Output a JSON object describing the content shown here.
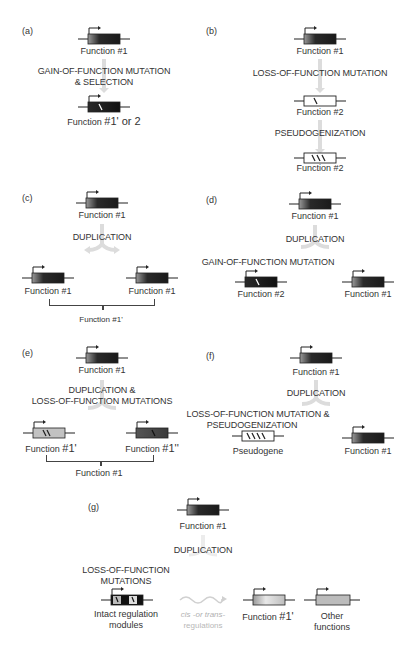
{
  "figure": {
    "page_number_hint": "",
    "panels": {
      "a": {
        "label": "(a)",
        "top_gene": "Function #1",
        "step": [
          "GAIN-OF-FUNCTION MUTATION",
          "& SELECTION"
        ],
        "bottom_gene_prefix": "Function ",
        "bottom_gene_suffix": "#1' or 2"
      },
      "b": {
        "label": "(b)",
        "top_gene": "Function #1",
        "step1": "LOSS-OF-FUNCTION MUTATION",
        "mid_gene": "Function #2",
        "step2": "PSEUDOGENIZATION",
        "bottom_gene": "Function #2"
      },
      "c": {
        "label": "(c)",
        "top_gene": "Function #1",
        "step": "DUPLICATION",
        "left_gene": "Function #1",
        "right_gene": "Function #1",
        "combined": "Function #1'"
      },
      "d": {
        "label": "(d)",
        "top_gene": "Function #1",
        "step": "DUPLICATION",
        "branch_step": "GAIN-OF-FUNCTION MUTATION",
        "left_gene": "Function #2",
        "right_gene": "Function #1"
      },
      "e": {
        "label": "(e)",
        "top_gene": "Function #1",
        "step": [
          "DUPLICATION &",
          "LOSS-OF-FUNCTION MUTATIONS"
        ],
        "left_gene_prefix": "Function ",
        "left_gene_suffix": "#1'",
        "right_gene_prefix": "Function ",
        "right_gene_suffix": "#1''",
        "combined": "Function #1"
      },
      "f": {
        "label": "(f)",
        "top_gene": "Function #1",
        "step": "DUPLICATION",
        "branch_step": [
          "LOSS-OF-FUNCTION MUTATION &",
          "PSEUDOGENIZATION"
        ],
        "left_gene": "Pseudogene",
        "right_gene": "Function #1"
      },
      "g": {
        "label": "(g)",
        "top_gene": "Function #1",
        "step": "DUPLICATION",
        "branch_step": [
          "LOSS-OF-FUNCTION",
          "MUTATIONS"
        ],
        "left_gene": [
          "Intact regulation",
          "modules"
        ],
        "regulation": [
          "cis -or trans-",
          "regulations"
        ],
        "mid_gene_prefix": "Function ",
        "mid_gene_suffix": "#1'",
        "right_gene": [
          "Other",
          "functions"
        ]
      }
    },
    "colors": {
      "gene_dark": "#1a1a1a",
      "gene_mid": "#5a5a5a",
      "gene_light": "#c8c8c8",
      "arrow_grey": "#dcdcdc",
      "line": "#222222"
    }
  }
}
